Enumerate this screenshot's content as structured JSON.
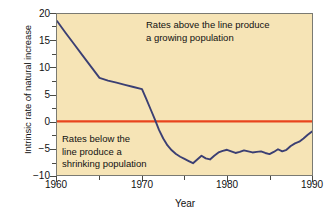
{
  "chart_data": {
    "type": "line",
    "title": "",
    "xlabel": "Year",
    "ylabel": "Intrinsic rate of natural increase",
    "xlim": [
      1960,
      1990
    ],
    "ylim": [
      -10,
      20
    ],
    "grid": false,
    "legend": "none",
    "background_color": "#f6e4b6",
    "series": [
      {
        "name": "Intrinsic rate of natural increase",
        "color": "#3b3f73",
        "x": [
          1960,
          1961,
          1962,
          1963,
          1964,
          1965,
          1966,
          1967,
          1968,
          1969,
          1970,
          1970.5,
          1971,
          1971.5,
          1972,
          1972.5,
          1973,
          1973.5,
          1974,
          1974.5,
          1975,
          1975.5,
          1976,
          1976.5,
          1977,
          1977.5,
          1978,
          1978.5,
          1979,
          1979.5,
          1980,
          1980.5,
          1981,
          1981.5,
          1982,
          1982.5,
          1983,
          1983.5,
          1984,
          1984.5,
          1985,
          1985.5,
          1986,
          1986.5,
          1987,
          1987.5,
          1988,
          1988.5,
          1989,
          1989.5,
          1990
        ],
        "values": [
          18.7,
          16.5,
          14.4,
          12.3,
          10.2,
          8.1,
          7.6,
          7.2,
          6.8,
          6.4,
          6.0,
          4.2,
          2.3,
          0.4,
          -1.6,
          -3.2,
          -4.5,
          -5.4,
          -6.1,
          -6.6,
          -7.0,
          -7.4,
          -7.8,
          -7.1,
          -6.4,
          -6.9,
          -7.1,
          -6.4,
          -5.8,
          -5.5,
          -5.3,
          -5.6,
          -5.9,
          -5.7,
          -5.4,
          -5.6,
          -5.8,
          -5.7,
          -5.6,
          -5.9,
          -6.1,
          -5.7,
          -5.2,
          -5.6,
          -5.3,
          -4.6,
          -4.1,
          -3.8,
          -3.2,
          -2.5,
          -1.9
        ]
      }
    ],
    "reference_line": {
      "name": "zero-replacement-line",
      "value": 0,
      "color": "#e8451e",
      "orientation": "horizontal"
    },
    "y_ticks": [
      {
        "value": 20,
        "label": "20",
        "major": true
      },
      {
        "value": 17.5,
        "label": "",
        "major": false
      },
      {
        "value": 15,
        "label": "15",
        "major": true
      },
      {
        "value": 12.5,
        "label": "",
        "major": false
      },
      {
        "value": 10,
        "label": "10",
        "major": true
      },
      {
        "value": 7.5,
        "label": "",
        "major": false
      },
      {
        "value": 5,
        "label": "5",
        "major": true
      },
      {
        "value": 2.5,
        "label": "",
        "major": false
      },
      {
        "value": 0,
        "label": "0",
        "major": true
      },
      {
        "value": -2.5,
        "label": "",
        "major": false
      },
      {
        "value": -5,
        "label": "−5",
        "major": true
      },
      {
        "value": -7.5,
        "label": "",
        "major": false
      },
      {
        "value": -10,
        "label": "−10",
        "major": true
      }
    ],
    "x_ticks": [
      {
        "value": 1960,
        "label": "1960",
        "major": true
      },
      {
        "value": 1965,
        "label": "",
        "major": false
      },
      {
        "value": 1970,
        "label": "1970",
        "major": true
      },
      {
        "value": 1975,
        "label": "",
        "major": false
      },
      {
        "value": 1980,
        "label": "1980",
        "major": true
      },
      {
        "value": 1985,
        "label": "",
        "major": false
      },
      {
        "value": 1990,
        "label": "1990",
        "major": true
      }
    ],
    "annotations": [
      {
        "name": "above-line-note",
        "text": "Rates above the line produce\na growing population",
        "x": 1977,
        "y": 17
      },
      {
        "name": "below-line-note",
        "text": "Rates below the\nline produce a\nshrinking population",
        "x": 1963,
        "y": -3
      }
    ]
  }
}
